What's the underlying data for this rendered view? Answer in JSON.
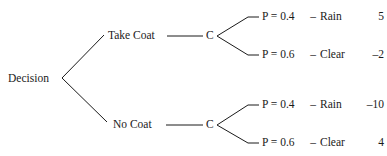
{
  "diagram": {
    "type": "decision-tree",
    "background_color": "#ffffff",
    "line_color": "#1a1a1a",
    "text_color": "#1a1a1a",
    "root": {
      "label": "Decision",
      "node_type": "decision"
    },
    "branches": [
      {
        "label": "Take Coat",
        "chance_node_label": "C",
        "outcomes": [
          {
            "probability": "P = 0.4",
            "separator": "–",
            "state": "Rain",
            "payoff": "5"
          },
          {
            "probability": "P = 0.6",
            "separator": "–",
            "state": "Clear",
            "payoff": "–2"
          }
        ]
      },
      {
        "label": "No Coat",
        "chance_node_label": "C",
        "outcomes": [
          {
            "probability": "P = 0.4",
            "separator": "–",
            "state": "Rain",
            "payoff": "–10"
          },
          {
            "probability": "P = 0.6",
            "separator": "–",
            "state": "Clear",
            "payoff": "4"
          }
        ]
      }
    ]
  }
}
